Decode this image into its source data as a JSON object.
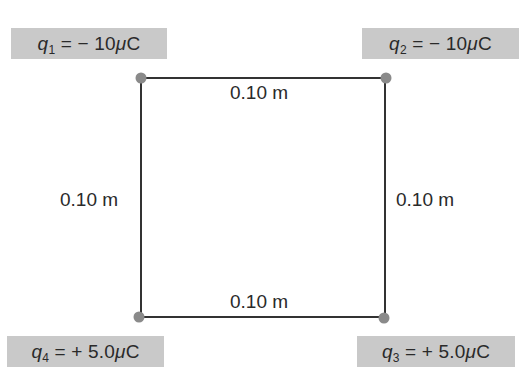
{
  "diagram": {
    "type": "square-charge-arrangement",
    "colors": {
      "label_box": "#c9c9c9",
      "text": "#2a2a2a",
      "square_edge": "#333333",
      "charge_dot": "#8a8a8a"
    },
    "charges": [
      {
        "id": "q1",
        "symbol": "q",
        "subscript": "1",
        "equals": " = ",
        "sign": "− ",
        "value": "10",
        "unit_prefix": "μ",
        "unit": "C",
        "corner": "top-left"
      },
      {
        "id": "q2",
        "symbol": "q",
        "subscript": "2",
        "equals": " = ",
        "sign": "− ",
        "value": "10",
        "unit_prefix": "μ",
        "unit": "C",
        "corner": "top-right"
      },
      {
        "id": "q3",
        "symbol": "q",
        "subscript": "3",
        "equals": " = ",
        "sign": "+ ",
        "value": "5.0",
        "unit_prefix": "μ",
        "unit": "C",
        "corner": "bottom-right"
      },
      {
        "id": "q4",
        "symbol": "q",
        "subscript": "4",
        "equals": " = ",
        "sign": "+ ",
        "value": "5.0",
        "unit_prefix": "μ",
        "unit": "C",
        "corner": "bottom-left"
      }
    ],
    "dimensions": {
      "top": "0.10 m",
      "bottom": "0.10 m",
      "left": "0.10 m",
      "right": "0.10 m"
    }
  }
}
